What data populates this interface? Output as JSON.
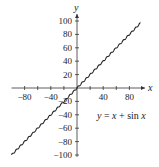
{
  "chart_data": {
    "type": "line",
    "title": "",
    "equation": "y = x + sin x",
    "xlabel": "x",
    "ylabel": "y",
    "xlim": [
      -100,
      100
    ],
    "ylim": [
      -100,
      100
    ],
    "x_ticks": [
      -80,
      -60,
      -40,
      -20,
      20,
      40,
      60,
      80
    ],
    "x_tick_labels": [
      "−80",
      "−40",
      "40",
      "80"
    ],
    "x_tick_label_values": [
      -80,
      -40,
      40,
      80
    ],
    "y_ticks": [
      -100,
      -80,
      -60,
      -40,
      -20,
      20,
      40,
      60,
      80,
      100
    ],
    "y_tick_labels": [
      "100",
      "80",
      "60",
      "40",
      "20",
      "−20",
      "−40",
      "−60",
      "−80",
      "−100"
    ],
    "y_tick_label_values": [
      100,
      80,
      60,
      40,
      20,
      -20,
      -40,
      -60,
      -80,
      -100
    ],
    "grid": false,
    "legend": "none",
    "series": [
      {
        "name": "y = x + sin x",
        "x_range": [
          -100,
          100
        ],
        "function": "x + sin(x)"
      }
    ]
  },
  "labels": {
    "x_axis": "x",
    "y_axis": "y",
    "equation_parts": {
      "lhs": "y",
      "eq": " = ",
      "x": "x",
      "plus": " + sin ",
      "x2": "x"
    }
  }
}
